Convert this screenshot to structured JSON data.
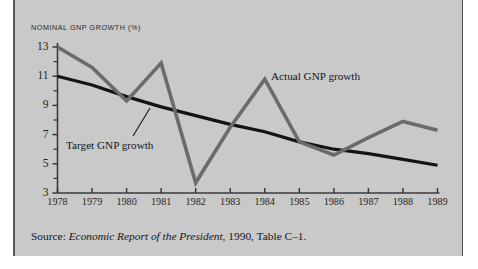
{
  "figure": {
    "axis_title": "NOMINAL GNP GROWTH (%)",
    "source_prefix": "Source:",
    "source_italic": "Economic Report of the President",
    "source_suffix": ", 1990, Table C–1.",
    "plate_color": "#c9c9c9",
    "rule_color": "#55565a"
  },
  "chart_data": {
    "type": "line",
    "title": "NOMINAL GNP GROWTH (%)",
    "xlabel": "",
    "ylabel": "NOMINAL GNP GROWTH (%)",
    "x": [
      "1978",
      "1979",
      "1980",
      "1981",
      "1982",
      "1983",
      "1984",
      "1985",
      "1986",
      "1987",
      "1988",
      "1989"
    ],
    "xlim": [
      1978,
      1989
    ],
    "ylim": [
      3,
      13
    ],
    "yticks": [
      3,
      5,
      7,
      9,
      11,
      13
    ],
    "yticks_minor": [
      4,
      6,
      8,
      10,
      12
    ],
    "grid": false,
    "legend": "annotations",
    "series": [
      {
        "name": "Actual GNP growth",
        "color": "#6b6b6b",
        "width": 3.6,
        "values": [
          13.0,
          11.6,
          9.3,
          11.9,
          3.7,
          7.5,
          10.8,
          6.5,
          5.6,
          6.8,
          7.9,
          7.3
        ]
      },
      {
        "name": "Target GNP growth",
        "color": "#141416",
        "width": 3.2,
        "values": [
          11.0,
          10.4,
          9.6,
          8.9,
          8.3,
          7.7,
          7.2,
          6.5,
          6.0,
          5.7,
          5.3,
          4.9
        ]
      }
    ],
    "annotations": [
      {
        "text": "Actual GNP growth",
        "x": 1984,
        "y": 10.8
      },
      {
        "text": "Target GNP growth",
        "x": 1980,
        "y": 6.2,
        "leader": true
      }
    ]
  },
  "ylabels": [
    "13",
    "11",
    "9",
    "7",
    "5",
    "3"
  ],
  "xlabels": [
    "1978",
    "1979",
    "1980",
    "1981",
    "1982",
    "1983",
    "1984",
    "1985",
    "1986",
    "1987",
    "1988",
    "1989"
  ]
}
